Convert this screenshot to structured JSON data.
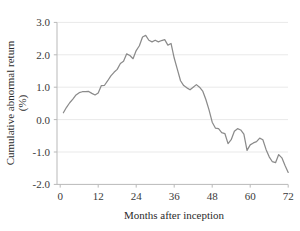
{
  "chart_data": {
    "type": "line",
    "title": "",
    "subtitle": "",
    "xlabel": "Months after inception",
    "ylabel": "Cumulative abnormal return (%)",
    "ylabel_line1": "Cumulative abnormal return",
    "ylabel_line2": "(%)",
    "xlim": [
      0,
      72
    ],
    "ylim": [
      -2.0,
      3.0
    ],
    "grid": true,
    "grid_axis": "y",
    "legend": false,
    "legend_position": "none",
    "line_color": "#8b8b8b",
    "background_color": "#ffffff",
    "xticks": [
      0,
      12,
      24,
      36,
      48,
      60,
      72
    ],
    "xticklabels": [
      "0",
      "12",
      "24",
      "36",
      "48",
      "60",
      "72"
    ],
    "yticks": [
      -2.0,
      -1.0,
      0.0,
      1.0,
      2.0,
      3.0
    ],
    "yticklabels": [
      "-2.0",
      "-1.0",
      "0.0",
      "1.0",
      "2.0",
      "3.0"
    ],
    "series": [
      {
        "name": "Cumulative abnormal return",
        "x": [
          1,
          2,
          3,
          4,
          5,
          6,
          7,
          8,
          9,
          10,
          11,
          12,
          13,
          14,
          15,
          16,
          17,
          18,
          19,
          20,
          21,
          22,
          23,
          24,
          25,
          26,
          27,
          28,
          29,
          30,
          31,
          32,
          33,
          34,
          35,
          36,
          37,
          38,
          39,
          40,
          41,
          42,
          43,
          44,
          45,
          46,
          47,
          48,
          49,
          50,
          51,
          52,
          53,
          54,
          55,
          56,
          57,
          58,
          59,
          60,
          61,
          62,
          63,
          64,
          65,
          66,
          67,
          68,
          69,
          70,
          71,
          72
        ],
        "values": [
          0.21,
          0.38,
          0.52,
          0.63,
          0.76,
          0.83,
          0.86,
          0.86,
          0.87,
          0.81,
          0.76,
          0.82,
          1.05,
          1.06,
          1.2,
          1.35,
          1.46,
          1.55,
          1.73,
          1.8,
          2.03,
          1.98,
          1.88,
          2.13,
          2.28,
          2.55,
          2.6,
          2.45,
          2.4,
          2.45,
          2.4,
          2.44,
          2.47,
          2.3,
          2.35,
          1.9,
          1.55,
          1.2,
          1.05,
          0.98,
          0.92,
          1.0,
          1.08,
          1.0,
          0.88,
          0.62,
          0.3,
          -0.08,
          -0.26,
          -0.28,
          -0.4,
          -0.43,
          -0.74,
          -0.62,
          -0.36,
          -0.28,
          -0.32,
          -0.45,
          -0.95,
          -0.78,
          -0.72,
          -0.68,
          -0.57,
          -0.62,
          -0.92,
          -1.15,
          -1.3,
          -1.33,
          -1.08,
          -1.18,
          -1.42,
          -1.63
        ]
      }
    ],
    "peak": {
      "x": 27,
      "y": 2.6
    },
    "start": {
      "x": 1,
      "y": 0.21
    },
    "end": {
      "x": 72,
      "y": -1.63
    }
  }
}
